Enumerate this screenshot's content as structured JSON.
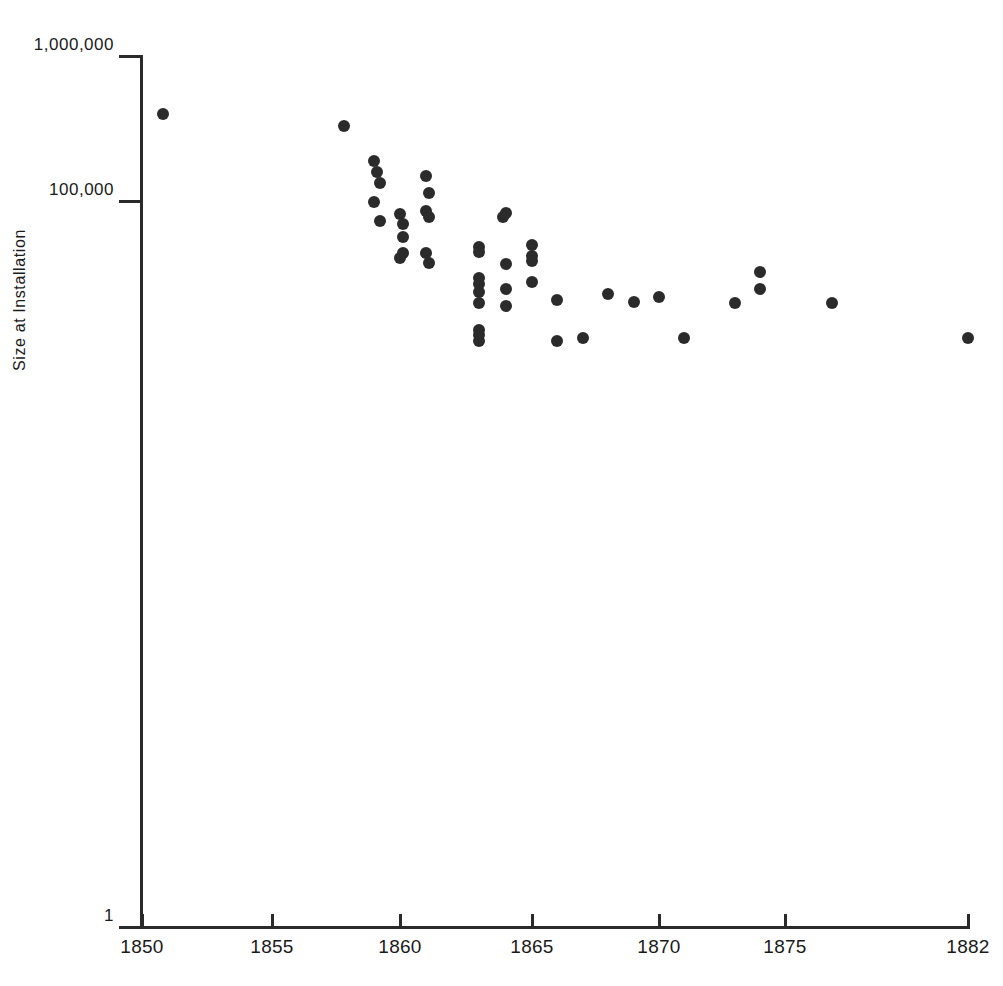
{
  "chart_data": {
    "type": "scatter",
    "title": "",
    "subtitle": "",
    "xlabel": "",
    "ylabel": "Size at Installation",
    "x_tick_labels": [
      "1850",
      "1855",
      "1860",
      "1865",
      "1870",
      "1875",
      "1882"
    ],
    "x_ticks": [
      1850,
      1855,
      1860,
      1865,
      1870,
      1875,
      1882
    ],
    "y_tick_labels": [
      "1,000,000",
      "100,000",
      "1"
    ],
    "y_ticks": [
      1000000,
      100000,
      1
    ],
    "yscale": "log",
    "xscale": "linear",
    "xlim": [
      1850,
      1882
    ],
    "ylim": [
      1,
      1000000
    ],
    "grid": false,
    "legend": null,
    "marker": "filled-circle",
    "marker_color": "#2b2b2b",
    "points": [
      {
        "x": 1850.8,
        "y": 400000
      },
      {
        "x": 1857.8,
        "y": 330000
      },
      {
        "x": 1859.0,
        "y": 190000
      },
      {
        "x": 1859.1,
        "y": 160000
      },
      {
        "x": 1859.2,
        "y": 135000
      },
      {
        "x": 1861.0,
        "y": 150000
      },
      {
        "x": 1861.1,
        "y": 115000
      },
      {
        "x": 1859.0,
        "y": 100000
      },
      {
        "x": 1861.0,
        "y": 86000
      },
      {
        "x": 1860.0,
        "y": 82000
      },
      {
        "x": 1861.1,
        "y": 78000
      },
      {
        "x": 1859.2,
        "y": 74000
      },
      {
        "x": 1860.1,
        "y": 70000
      },
      {
        "x": 1864.0,
        "y": 84000
      },
      {
        "x": 1863.9,
        "y": 78000
      },
      {
        "x": 1860.1,
        "y": 57000
      },
      {
        "x": 1860.1,
        "y": 44000
      },
      {
        "x": 1861.0,
        "y": 44000
      },
      {
        "x": 1860.0,
        "y": 41000
      },
      {
        "x": 1861.1,
        "y": 38000
      },
      {
        "x": 1863.0,
        "y": 49000
      },
      {
        "x": 1863.0,
        "y": 45000
      },
      {
        "x": 1865.0,
        "y": 50000
      },
      {
        "x": 1865.0,
        "y": 42000
      },
      {
        "x": 1865.0,
        "y": 39000
      },
      {
        "x": 1864.0,
        "y": 37000
      },
      {
        "x": 1863.0,
        "y": 30000
      },
      {
        "x": 1863.0,
        "y": 27000
      },
      {
        "x": 1863.0,
        "y": 24000
      },
      {
        "x": 1864.0,
        "y": 25000
      },
      {
        "x": 1865.0,
        "y": 28000
      },
      {
        "x": 1863.0,
        "y": 20000
      },
      {
        "x": 1864.0,
        "y": 19000
      },
      {
        "x": 1866.0,
        "y": 21000
      },
      {
        "x": 1863.0,
        "y": 13000
      },
      {
        "x": 1863.0,
        "y": 12000
      },
      {
        "x": 1863.0,
        "y": 11000
      },
      {
        "x": 1866.0,
        "y": 11000
      },
      {
        "x": 1867.0,
        "y": 11500
      },
      {
        "x": 1868.0,
        "y": 23000
      },
      {
        "x": 1869.0,
        "y": 20500
      },
      {
        "x": 1870.0,
        "y": 22000
      },
      {
        "x": 1871.0,
        "y": 11500
      },
      {
        "x": 1873.0,
        "y": 20000
      },
      {
        "x": 1874.0,
        "y": 25000
      },
      {
        "x": 1874.0,
        "y": 33000
      },
      {
        "x": 1876.8,
        "y": 20000
      },
      {
        "x": 1882.0,
        "y": 11500
      }
    ]
  },
  "axis": {
    "y_title": "Size at Installation"
  }
}
